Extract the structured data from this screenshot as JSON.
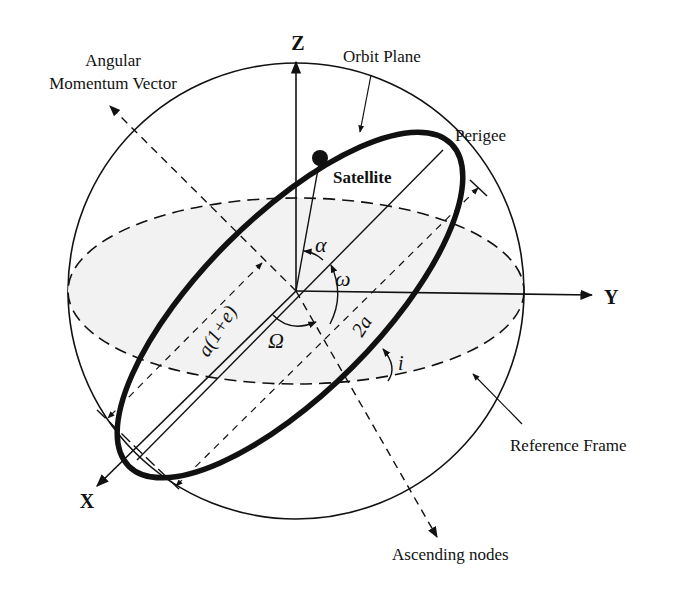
{
  "diagram": {
    "labels": {
      "angular_momentum_line1": "Angular",
      "angular_momentum_line2": "Momentum Vector",
      "z_axis": "Z",
      "y_axis": "Y",
      "x_axis": "X",
      "orbit_plane": "Orbit Plane",
      "perigee": "Perigee",
      "satellite": "Satellite",
      "alpha": "α",
      "omega_small": "ω",
      "omega_capital": "Ω",
      "semi_axis": "a(1+e)",
      "major_axis": "2a",
      "inclination": "i",
      "reference_frame": "Reference Frame",
      "ascending_nodes": "Ascending nodes"
    },
    "colors": {
      "stroke": "#111111",
      "equatorial_fill": "#f2f2f2",
      "background": "#ffffff"
    }
  }
}
